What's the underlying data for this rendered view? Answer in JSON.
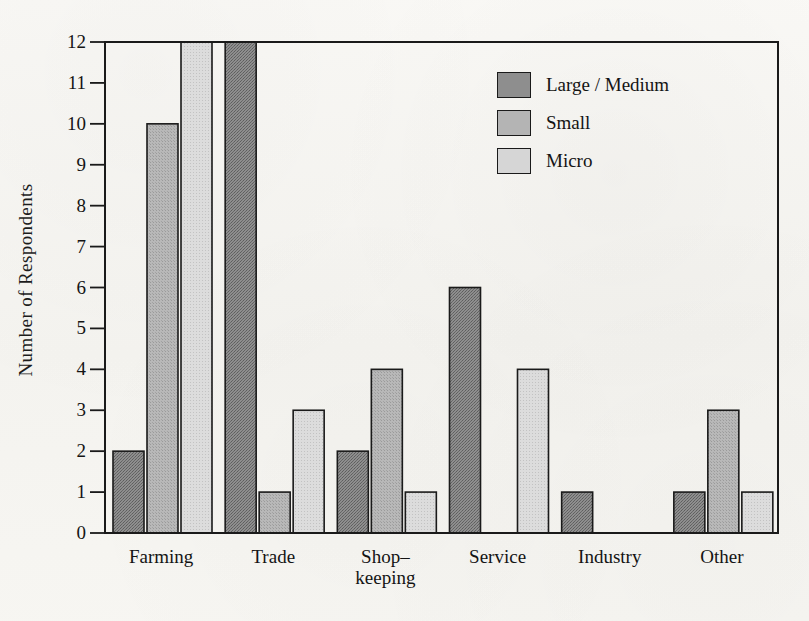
{
  "chart_data": {
    "type": "bar",
    "title": "",
    "xlabel": "",
    "ylabel": "Number of Respondents",
    "ylim": [
      0,
      12
    ],
    "yticks": [
      0,
      1,
      2,
      3,
      4,
      5,
      6,
      7,
      8,
      9,
      10,
      11,
      12
    ],
    "grid": false,
    "legend_position": "top-right",
    "categories": [
      "Farming",
      "Trade",
      "Shop–\nkeeping",
      "Service",
      "Industry",
      "Other"
    ],
    "category_labels_flat": [
      "Farming",
      "Trade",
      "Shop–keeping",
      "Service",
      "Industry",
      "Other"
    ],
    "series": [
      {
        "name": "Large / Medium",
        "color": "#8e8e8e",
        "values": [
          2,
          12,
          2,
          6,
          1,
          1
        ]
      },
      {
        "name": "Small",
        "color": "#b4b4b4",
        "values": [
          10,
          1,
          4,
          0,
          0,
          3
        ]
      },
      {
        "name": "Micro",
        "color": "#d6d6d6",
        "values": [
          12,
          3,
          1,
          4,
          0,
          1
        ]
      }
    ]
  },
  "legend": {
    "items": [
      {
        "label": "Large / Medium",
        "color": "#8e8e8e"
      },
      {
        "label": "Small",
        "color": "#b4b4b4"
      },
      {
        "label": "Micro",
        "color": "#d6d6d6"
      }
    ]
  },
  "axis": {
    "y_title": "Number of Respondents",
    "tick_values": [
      "12",
      "11",
      "10",
      "9",
      "8",
      "7",
      "6",
      "5",
      "4",
      "3",
      "2",
      "1",
      "0"
    ]
  }
}
